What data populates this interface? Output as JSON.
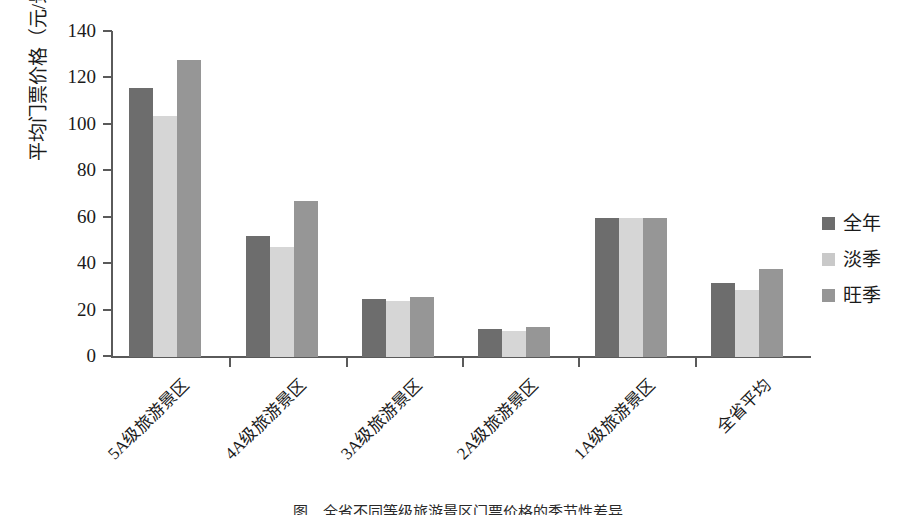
{
  "chart_data": {
    "type": "bar",
    "title": "",
    "xlabel": "",
    "ylabel": "平均门票价格（元/景区）",
    "ylim": [
      0,
      140
    ],
    "ytick_values": [
      0,
      20,
      40,
      60,
      80,
      100,
      120,
      140
    ],
    "ytick_labels": [
      "0",
      "20",
      "40",
      "60",
      "80",
      "100",
      "120",
      "140"
    ],
    "grid": false,
    "legend_position": "right",
    "categories": [
      "5A级旅游景区",
      "4A级旅游景区",
      "3A级旅游景区",
      "2A级旅游景区",
      "1A级旅游景区",
      "全省平均"
    ],
    "series": [
      {
        "name": "全年",
        "color": "#6d6d6d",
        "values": [
          116,
          52,
          25,
          12,
          60,
          32
        ]
      },
      {
        "name": "淡季",
        "color": "#d6d6d6",
        "values": [
          104,
          47.5,
          24,
          11,
          60,
          29
        ]
      },
      {
        "name": "旺季",
        "color": "#969696",
        "values": [
          128,
          67,
          26,
          13,
          60,
          38
        ]
      }
    ]
  },
  "legend": {
    "items": [
      {
        "label": "全年",
        "swatch": "#6d6d6d"
      },
      {
        "label": "淡季",
        "swatch": "#c9c9c9"
      },
      {
        "label": "旺季",
        "swatch": "#969696"
      }
    ]
  },
  "caption": {
    "text": "图　全省不同等级旅游景区门票价格的季节性差异"
  }
}
